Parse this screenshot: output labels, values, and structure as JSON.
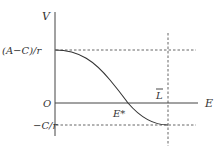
{
  "diagram": {
    "type": "function-curve",
    "axes": {
      "y_label": "V",
      "x_label": "E",
      "origin_label": "O"
    },
    "levels": {
      "upper": "(A−C)/r",
      "lower": "−C/r"
    },
    "points": {
      "crossing": "E*",
      "bound": "L",
      "bound_overline": true
    },
    "colors": {
      "axis": "#444444",
      "curve": "#333333",
      "dashed": "#666666",
      "text": "#333333"
    }
  }
}
